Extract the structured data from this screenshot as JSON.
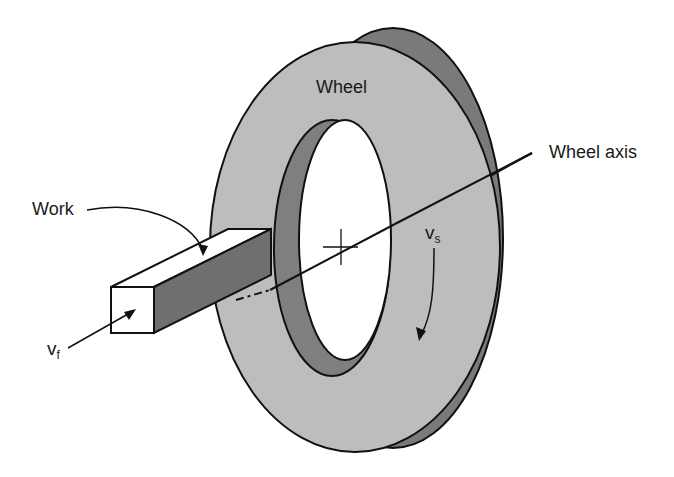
{
  "figure": {
    "labels": {
      "wheel": "Wheel",
      "wheel_axis": "Wheel axis",
      "work": "Work",
      "vs_base": "v",
      "vs_sub": "s",
      "vf_base": "v",
      "vf_sub": "f"
    },
    "colors": {
      "wheel_face": "#bdbdbd",
      "wheel_rim": "#7a7a7a",
      "bore_inner": "#7f7f7f",
      "work_top": "#ffffff",
      "work_side": "#6f6f6f",
      "work_end": "#ffffff",
      "outline": "#111111",
      "background": "#ffffff"
    }
  }
}
